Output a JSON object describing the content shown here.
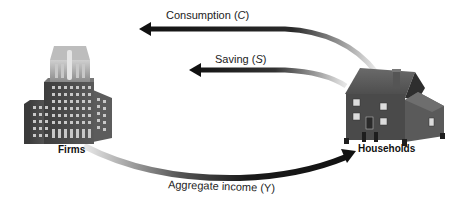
{
  "diagram": {
    "type": "circular-flow",
    "nodes": {
      "firms": {
        "label": "Firms",
        "icon": "office-building-icon"
      },
      "households": {
        "label": "Households",
        "icon": "house-icon"
      }
    },
    "flows": {
      "consumption": {
        "label": "Consumption",
        "symbol": "C",
        "from": "Households",
        "to": "Firms"
      },
      "saving": {
        "label": "Saving",
        "symbol": "S",
        "from": "Households",
        "to": "Firms"
      },
      "income": {
        "label": "Aggregate income",
        "symbol": "Y",
        "from": "Firms",
        "to": "Households"
      }
    },
    "colors": {
      "arrow_dark": "#1a1a1a",
      "arrow_fade": "#d8d8d8",
      "building": "#555555",
      "background": "#ffffff"
    }
  }
}
